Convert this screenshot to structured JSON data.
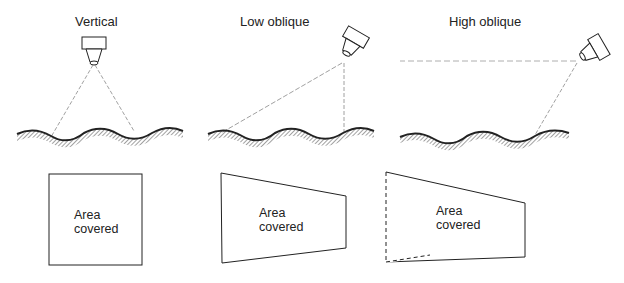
{
  "panels": [
    {
      "id": "vertical",
      "title": "Vertical",
      "footprint_label_line1": "Area",
      "footprint_label_line2": "covered"
    },
    {
      "id": "low-oblique",
      "title": "Low oblique",
      "footprint_label_line1": "Area",
      "footprint_label_line2": "covered"
    },
    {
      "id": "high-oblique",
      "title": "High oblique",
      "footprint_label_line1": "Area",
      "footprint_label_line2": "covered"
    }
  ],
  "colors": {
    "line": "#222222",
    "ray": "#888888",
    "background": "#ffffff"
  }
}
